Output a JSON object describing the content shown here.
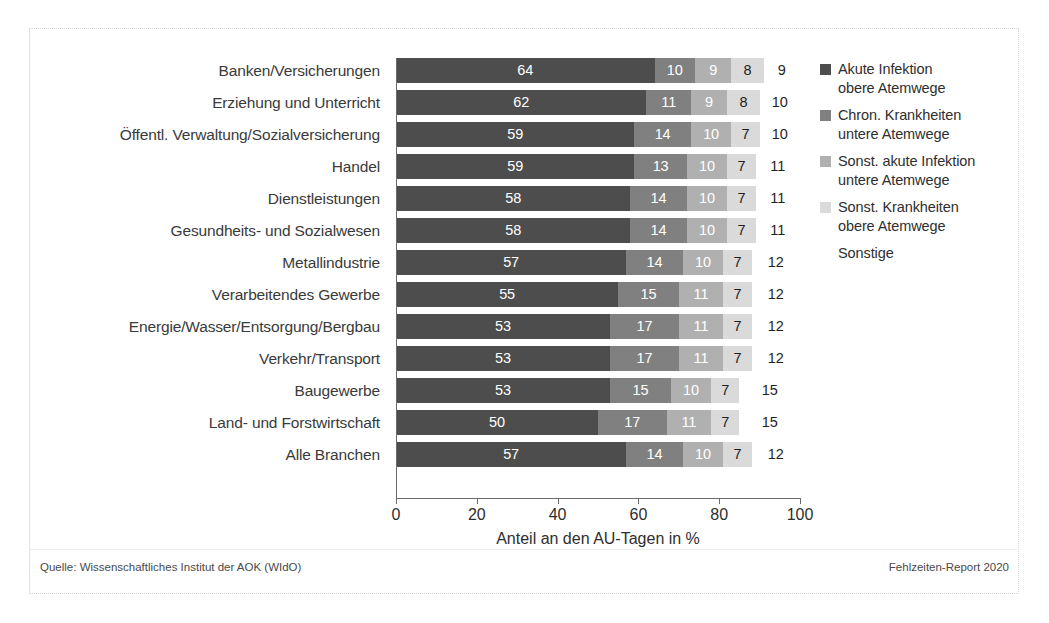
{
  "chart_data": {
    "type": "bar",
    "orientation": "horizontal",
    "stacked": true,
    "title": "",
    "xlabel": "Anteil an den AU-Tagen in %",
    "ylabel": "",
    "xlim": [
      0,
      100
    ],
    "xticks": [
      "0",
      "20",
      "40",
      "60",
      "80",
      "100"
    ],
    "grid": false,
    "legend_position": "right",
    "categories": [
      "Banken/Versicherungen",
      "Erziehung und Unterricht",
      "Öffentl. Verwaltung/Sozialversicherung",
      "Handel",
      "Dienstleistungen",
      "Gesundheits- und Sozialwesen",
      "Metallindustrie",
      "Verarbeitendes Gewerbe",
      "Energie/Wasser/Entsorgung/Bergbau",
      "Verkehr/Transport",
      "Baugewerbe",
      "Land- und Forstwirtschaft",
      "Alle Branchen"
    ],
    "series": [
      {
        "name": "Akute Infektion obere Atemwege",
        "color": "#4d4d4d",
        "label_color": "#ffffff",
        "values": [
          64,
          62,
          59,
          59,
          58,
          58,
          57,
          55,
          53,
          53,
          53,
          50,
          57
        ]
      },
      {
        "name": "Chron. Krankheiten untere Atemwege",
        "color": "#808080",
        "label_color": "#ffffff",
        "values": [
          10,
          11,
          14,
          13,
          14,
          14,
          14,
          15,
          17,
          17,
          15,
          17,
          14
        ]
      },
      {
        "name": "Sonst. akute Infektion untere Atemwege",
        "color": "#b0b0b0",
        "label_color": "#ffffff",
        "values": [
          9,
          9,
          10,
          10,
          10,
          10,
          10,
          11,
          11,
          11,
          10,
          11,
          10
        ]
      },
      {
        "name": "Sonst. Krankheiten obere Atemwege",
        "color": "#dadada",
        "label_color": "#1f1f1f",
        "values": [
          8,
          8,
          7,
          7,
          7,
          7,
          7,
          7,
          7,
          7,
          7,
          7,
          7
        ]
      },
      {
        "name": "Sonstige",
        "color": "#ffffff",
        "label_color": "#1f1f1f",
        "values": [
          9,
          10,
          10,
          11,
          11,
          11,
          12,
          12,
          12,
          12,
          15,
          15,
          12
        ]
      }
    ]
  },
  "legend": {
    "items": [
      {
        "label": "Akute Infektion\nobere Atemwege",
        "color": "#4d4d4d"
      },
      {
        "label": "Chron. Krankheiten\nuntere Atemwege",
        "color": "#808080"
      },
      {
        "label": "Sonst. akute Infektion\nuntere Atemwege",
        "color": "#b0b0b0"
      },
      {
        "label": "Sonst. Krankheiten\nobere Atemwege",
        "color": "#dadada"
      },
      {
        "label": "Sonstige",
        "color": "#ffffff"
      }
    ]
  },
  "footer": {
    "source": "Quelle: Wissenschaftliches Institut der AOK (WIdO)",
    "report": "Fehlzeiten-Report 2020"
  }
}
